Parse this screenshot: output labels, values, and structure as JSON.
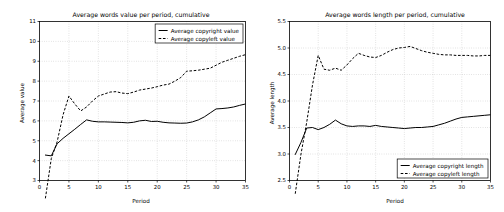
{
  "figure": {
    "background": "#ffffff",
    "line_color": "#000000",
    "grid_color": "#b0b0b0",
    "width": 504,
    "height": 212
  },
  "chart_data": [
    {
      "type": "line",
      "id": "left",
      "title": "Average words value per period, cumulative",
      "xlabel": "Period",
      "ylabel": "Average value",
      "xlim": [
        0,
        35
      ],
      "ylim": [
        3,
        11
      ],
      "xticks": [
        0,
        5,
        10,
        15,
        20,
        25,
        30,
        35
      ],
      "yticks": [
        3,
        4,
        5,
        6,
        7,
        8,
        9,
        10,
        11
      ],
      "xticklabels": [
        "0",
        "5",
        "10",
        "15",
        "20",
        "25",
        "30",
        "35"
      ],
      "yticklabels": [
        "3",
        "4",
        "5",
        "6",
        "7",
        "8",
        "9",
        "10",
        "11"
      ],
      "grid": true,
      "legend_position": "upper right",
      "x": [
        1,
        2,
        3,
        4,
        5,
        6,
        7,
        8,
        9,
        10,
        11,
        12,
        13,
        14,
        15,
        16,
        17,
        18,
        19,
        20,
        21,
        22,
        23,
        24,
        25,
        26,
        27,
        28,
        29,
        30,
        31,
        32,
        33,
        34,
        35
      ],
      "series": [
        {
          "name": "Average copyright value",
          "style": "solid",
          "values": [
            4.28,
            4.24,
            4.85,
            5.12,
            5.35,
            5.58,
            5.82,
            6.05,
            5.98,
            5.95,
            5.95,
            5.94,
            5.93,
            5.92,
            5.9,
            5.93,
            6.0,
            6.03,
            5.97,
            5.98,
            5.93,
            5.9,
            5.89,
            5.88,
            5.89,
            5.95,
            6.05,
            6.2,
            6.4,
            6.6,
            6.62,
            6.65,
            6.7,
            6.78,
            6.85
          ]
        },
        {
          "name": "Average copyleft value",
          "style": "dashed",
          "values": [
            2.1,
            4.1,
            4.95,
            6.3,
            7.25,
            6.85,
            6.5,
            6.7,
            7.0,
            7.25,
            7.35,
            7.45,
            7.47,
            7.4,
            7.37,
            7.45,
            7.55,
            7.6,
            7.65,
            7.72,
            7.8,
            7.85,
            8.0,
            8.18,
            8.5,
            8.52,
            8.55,
            8.6,
            8.65,
            8.8,
            8.95,
            9.05,
            9.15,
            9.25,
            9.33
          ]
        }
      ]
    },
    {
      "type": "line",
      "id": "right",
      "title": "Average words length per period, cumulative",
      "xlabel": "Period",
      "ylabel": "Average length",
      "xlim": [
        0,
        35
      ],
      "ylim": [
        2.5,
        5.5
      ],
      "xticks": [
        0,
        5,
        10,
        15,
        20,
        25,
        30,
        35
      ],
      "yticks": [
        2.5,
        3.0,
        3.5,
        4.0,
        4.5,
        5.0,
        5.5
      ],
      "xticklabels": [
        "0",
        "5",
        "10",
        "15",
        "20",
        "25",
        "30",
        "35"
      ],
      "yticklabels": [
        "2.5",
        "3.0",
        "3.5",
        "4.0",
        "4.5",
        "5.0",
        "5.5"
      ],
      "grid": true,
      "legend_position": "lower right",
      "x": [
        1,
        2,
        3,
        4,
        5,
        6,
        7,
        8,
        9,
        10,
        11,
        12,
        13,
        14,
        15,
        16,
        17,
        18,
        19,
        20,
        21,
        22,
        23,
        24,
        25,
        26,
        27,
        28,
        29,
        30,
        31,
        32,
        33,
        34,
        35
      ],
      "series": [
        {
          "name": "Average copyright length",
          "style": "solid",
          "values": [
            2.99,
            3.22,
            3.49,
            3.5,
            3.46,
            3.5,
            3.56,
            3.64,
            3.57,
            3.53,
            3.52,
            3.53,
            3.53,
            3.52,
            3.54,
            3.52,
            3.51,
            3.5,
            3.49,
            3.48,
            3.49,
            3.5,
            3.5,
            3.51,
            3.52,
            3.55,
            3.58,
            3.62,
            3.66,
            3.69,
            3.7,
            3.71,
            3.72,
            3.73,
            3.74
          ]
        },
        {
          "name": "Average copyleft length",
          "style": "dashed",
          "values": [
            2.25,
            3.0,
            3.6,
            4.3,
            4.86,
            4.6,
            4.58,
            4.62,
            4.58,
            4.68,
            4.8,
            4.9,
            4.86,
            4.83,
            4.82,
            4.86,
            4.92,
            4.97,
            5.0,
            5.01,
            5.03,
            4.99,
            4.95,
            4.92,
            4.9,
            4.88,
            4.87,
            4.87,
            4.86,
            4.86,
            4.86,
            4.85,
            4.85,
            4.86,
            4.86
          ]
        }
      ]
    }
  ]
}
